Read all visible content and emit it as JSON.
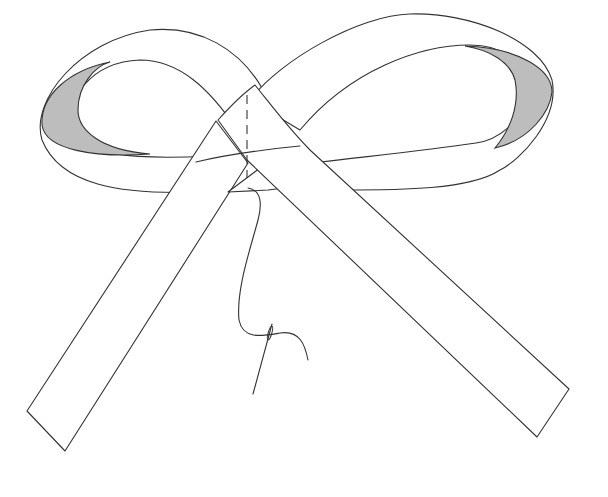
{
  "figure": {
    "subject": "Ribbon bow with stitched center, threaded needle and thread",
    "colors": {
      "background": "#ffffff",
      "line": "#333333",
      "loop_inner_shading": "#bdbdbd"
    },
    "elements": [
      {
        "name": "left-loop",
        "label": "Left ribbon loop"
      },
      {
        "name": "right-loop",
        "label": "Right ribbon loop"
      },
      {
        "name": "left-tail",
        "label": "Left ribbon tail"
      },
      {
        "name": "right-tail",
        "label": "Right ribbon tail"
      },
      {
        "name": "stitch-line",
        "label": "Dashed stitch line"
      },
      {
        "name": "thread",
        "label": "Thread"
      },
      {
        "name": "needle",
        "label": "Needle"
      }
    ]
  }
}
